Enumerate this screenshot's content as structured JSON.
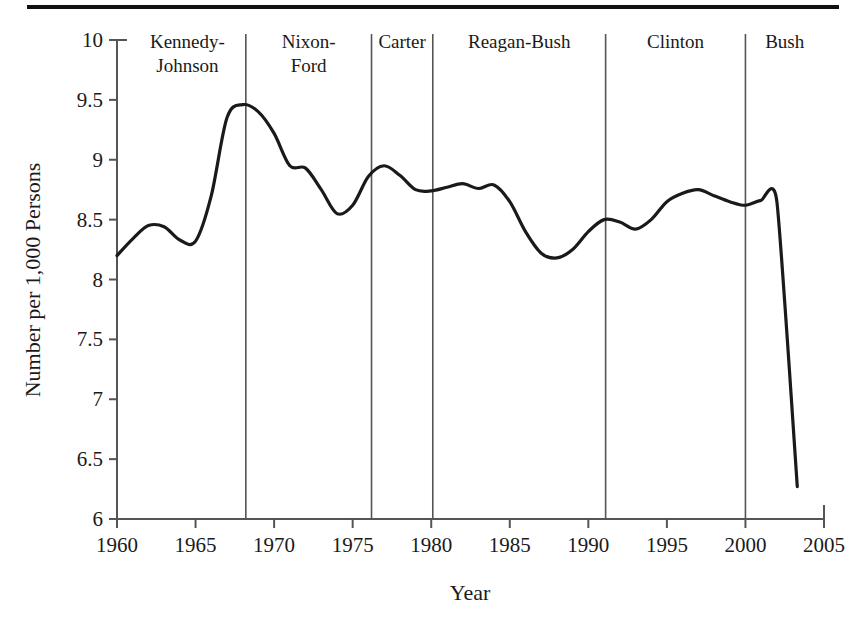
{
  "chart_data": {
    "type": "line",
    "title": "",
    "xlabel": "Year",
    "ylabel": "Number per 1,000 Persons",
    "xlim": [
      1960,
      2005
    ],
    "ylim": [
      6,
      10
    ],
    "grid": false,
    "legend": "none",
    "xticks": [
      "1960",
      "1965",
      "1970",
      "1975",
      "1980",
      "1985",
      "1990",
      "1995",
      "2000",
      "2005"
    ],
    "yticks": [
      "6",
      "6.5",
      "7",
      "7.5",
      "8",
      "8.5",
      "9",
      "9.5",
      "10"
    ],
    "series": [
      {
        "name": "Marriage rate",
        "color": "#1a1a1a",
        "x": [
          1960,
          1961,
          1962,
          1963,
          1964,
          1965,
          1966,
          1967,
          1968,
          1969,
          1970,
          1971,
          1972,
          1973,
          1974,
          1975,
          1976,
          1977,
          1978,
          1979,
          1980,
          1981,
          1982,
          1983,
          1984,
          1985,
          1986,
          1987,
          1988,
          1989,
          1990,
          1991,
          1992,
          1993,
          1994,
          1995,
          1996,
          1997,
          1998,
          1999,
          2000,
          2001,
          2002,
          2003.3
        ],
        "values": [
          8.2,
          8.34,
          8.45,
          8.44,
          8.33,
          8.32,
          8.7,
          9.35,
          9.46,
          9.4,
          9.22,
          8.95,
          8.93,
          8.75,
          8.55,
          8.62,
          8.86,
          8.95,
          8.87,
          8.75,
          8.74,
          8.77,
          8.8,
          8.76,
          8.79,
          8.65,
          8.4,
          8.22,
          8.18,
          8.25,
          8.4,
          8.5,
          8.48,
          8.42,
          8.5,
          8.65,
          8.72,
          8.75,
          8.7,
          8.65,
          8.62,
          8.66,
          8.65,
          6.27
        ],
        "annotated_points": [
          {
            "year": 1960,
            "value": 8.2,
            "note": "series start"
          },
          {
            "year": 1962,
            "value": 8.45,
            "note": "early local peak"
          },
          {
            "year": 1965,
            "value": 8.32,
            "note": "local dip"
          },
          {
            "year": 1967,
            "value": 9.46,
            "note": "series maximum"
          },
          {
            "year": 1972,
            "value": 8.55,
            "note": "local trough"
          },
          {
            "year": 1975,
            "value": 8.95,
            "note": "local peak"
          },
          {
            "year": 1982,
            "value": 8.18,
            "note": "1980s trough"
          },
          {
            "year": 1988,
            "value": 8.75,
            "note": "late-1980s peak"
          },
          {
            "year": 1991,
            "value": 8.65,
            "note": "Clinton era start"
          },
          {
            "year": 1998,
            "value": 7.55,
            "note": "local trough"
          },
          {
            "year": 2000,
            "value": 7.72,
            "note": "pre-drop peak"
          },
          {
            "year": 2002,
            "value": 6.25,
            "note": "series minimum"
          },
          {
            "year": 2003,
            "value": 6.27,
            "note": "series end"
          }
        ]
      }
    ],
    "eras": [
      {
        "label": "Kennedy-Johnson",
        "label_lines": [
          "Kennedy-",
          "Johnson"
        ],
        "start": 1960,
        "end": 1968.2
      },
      {
        "label": "Nixon-Ford",
        "label_lines": [
          "Nixon-",
          "Ford"
        ],
        "start": 1968.2,
        "end": 1976.2
      },
      {
        "label": "Carter",
        "label_lines": [
          "Carter"
        ],
        "start": 1976.2,
        "end": 1980.1
      },
      {
        "label": "Reagan-Bush",
        "label_lines": [
          "Reagan-Bush"
        ],
        "start": 1980.1,
        "end": 1991.1
      },
      {
        "label": "Clinton",
        "label_lines": [
          "Clinton"
        ],
        "start": 1991.1,
        "end": 2000.0
      },
      {
        "label": "Bush",
        "label_lines": [
          "Bush"
        ],
        "start": 2000.0,
        "end": 2005
      }
    ],
    "era_dividers": [
      1968.2,
      1976.2,
      1980.1,
      1991.1,
      2000.0
    ],
    "colors": {
      "line": "#1a1a1a",
      "axis": "#555555",
      "divider": "#555555",
      "rule": "#111111"
    }
  }
}
